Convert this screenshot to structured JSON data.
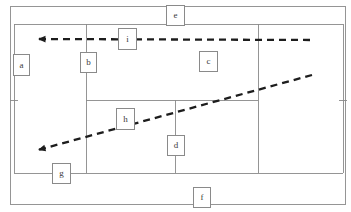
{
  "diagram": {
    "type": "tennis-court-schematic",
    "canvas": {
      "width": 351,
      "height": 212
    },
    "colors": {
      "background": "#ffffff",
      "court_line": "#8a8a8a",
      "trajectory_line": "#1d1d1d",
      "label_border": "#8a8a8a",
      "label_text": "#3a3a3a"
    },
    "court_lines": {
      "outer_boundary": {
        "x1": 10,
        "y1": 6,
        "x2": 345,
        "y2": 204
      },
      "doubles_sideline_left_x": 14,
      "doubles_sideline_right_x": 343,
      "baseline_top_y": 24,
      "baseline_bottom_y": 173,
      "singles_sideline_left_x": 86,
      "singles_sideline_right_x": 258,
      "center_service_line_x": 175,
      "service_line_y": 100,
      "center_mark_length": 8
    },
    "trajectories": [
      {
        "name": "horizontal-dashed-arrow",
        "label_ref": "i",
        "style": "dashed",
        "from": {
          "x": 310,
          "y": 40
        },
        "to": {
          "x": 38,
          "y": 39
        },
        "arrowhead_at": "to"
      },
      {
        "name": "diagonal-dashed-arrow",
        "label_ref": "h",
        "style": "dashed",
        "from": {
          "x": 312,
          "y": 75
        },
        "to": {
          "x": 38,
          "y": 150
        },
        "arrowhead_at": "to"
      }
    ],
    "labels": [
      {
        "id": "a",
        "text": "a",
        "x": 13,
        "y": 54,
        "w": 17,
        "h": 22,
        "name": "label-a"
      },
      {
        "id": "b",
        "text": "b",
        "x": 80,
        "y": 52,
        "w": 17,
        "h": 21,
        "name": "label-b"
      },
      {
        "id": "c",
        "text": "c",
        "x": 199,
        "y": 51,
        "w": 19,
        "h": 21,
        "name": "label-c"
      },
      {
        "id": "d",
        "text": "d",
        "x": 167,
        "y": 135,
        "w": 18,
        "h": 21,
        "name": "label-d"
      },
      {
        "id": "e",
        "text": "e",
        "x": 166,
        "y": 5,
        "w": 19,
        "h": 21,
        "name": "label-e"
      },
      {
        "id": "f",
        "text": "f",
        "x": 193,
        "y": 187,
        "w": 18,
        "h": 21,
        "name": "label-f"
      },
      {
        "id": "g",
        "text": "g",
        "x": 52,
        "y": 163,
        "w": 19,
        "h": 21,
        "name": "label-g"
      },
      {
        "id": "h",
        "text": "h",
        "x": 116,
        "y": 108,
        "w": 19,
        "h": 22,
        "name": "label-h"
      },
      {
        "id": "i",
        "text": "i",
        "x": 118,
        "y": 28,
        "w": 19,
        "h": 22,
        "name": "label-i"
      }
    ]
  }
}
